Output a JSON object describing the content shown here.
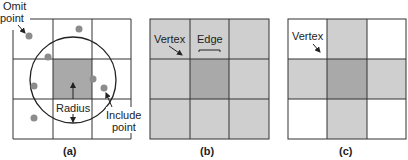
{
  "panels": [
    {
      "id": "a",
      "caption": "(a)",
      "labels": {
        "omit_line1": "Omit",
        "omit_line2": "point",
        "radius": "Radius",
        "include_line1": "Include",
        "include_line2": "point"
      }
    },
    {
      "id": "b",
      "caption": "(b)",
      "labels": {
        "vertex": "Vertex",
        "edge": "Edge"
      }
    },
    {
      "id": "c",
      "caption": "(c)",
      "labels": {
        "vertex": "Vertex"
      }
    }
  ],
  "colors": {
    "center_cell": "#a9a9a9",
    "neighbor_cell": "#cfcfcf",
    "empty_cell": "#ffffff",
    "point": "#8c8c8c",
    "line": "#333333"
  }
}
